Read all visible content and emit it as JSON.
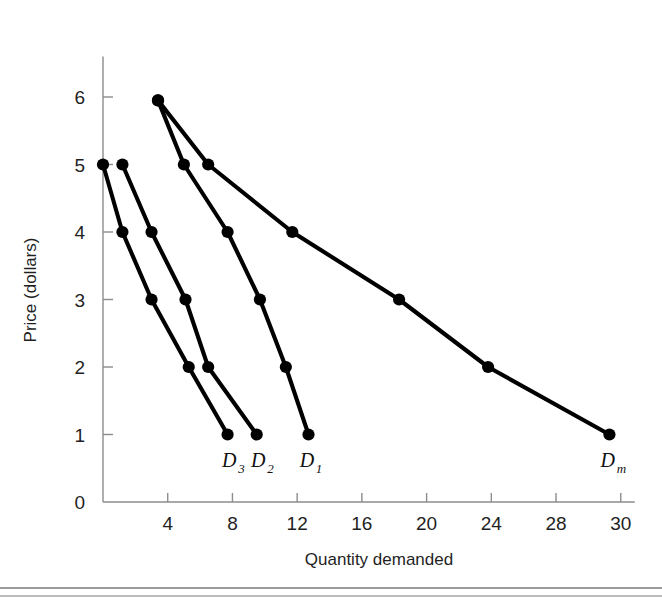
{
  "chart_data": {
    "type": "line",
    "title": "",
    "xlabel": "Quantity demanded",
    "ylabel": "Price (dollars)",
    "xlim": [
      0,
      32
    ],
    "ylim": [
      0,
      6.6
    ],
    "grid": false,
    "legend": "inline-end-labels",
    "x_ticks": [
      {
        "value": 4,
        "label": "4"
      },
      {
        "value": 8,
        "label": "8"
      },
      {
        "value": 12,
        "label": "12"
      },
      {
        "value": 16,
        "label": "16"
      },
      {
        "value": 20,
        "label": "20"
      },
      {
        "value": 24,
        "label": "24"
      },
      {
        "value": 28,
        "label": "28"
      },
      {
        "value": 32,
        "label": "30"
      }
    ],
    "y_ticks": [
      {
        "value": 0,
        "label": "0"
      },
      {
        "value": 1,
        "label": "1"
      },
      {
        "value": 2,
        "label": "2"
      },
      {
        "value": 3,
        "label": "3"
      },
      {
        "value": 4,
        "label": "4"
      },
      {
        "value": 5,
        "label": "5"
      },
      {
        "value": 6,
        "label": "6"
      }
    ],
    "series": [
      {
        "name": "D3",
        "label_base": "D",
        "label_sub": "3",
        "label_x": 7.8,
        "label_y": 0.52,
        "points": [
          {
            "x": 0.0,
            "y": 5.0
          },
          {
            "x": 1.2,
            "y": 4.0
          },
          {
            "x": 3.0,
            "y": 3.0
          },
          {
            "x": 5.3,
            "y": 2.0
          },
          {
            "x": 7.7,
            "y": 1.0
          }
        ]
      },
      {
        "name": "D2",
        "label_base": "D",
        "label_sub": "2",
        "label_x": 9.6,
        "label_y": 0.52,
        "points": [
          {
            "x": 1.2,
            "y": 5.0
          },
          {
            "x": 3.0,
            "y": 4.0
          },
          {
            "x": 5.1,
            "y": 3.0
          },
          {
            "x": 6.5,
            "y": 2.0
          },
          {
            "x": 9.5,
            "y": 1.0
          }
        ]
      },
      {
        "name": "D1",
        "label_base": "D",
        "label_sub": "1",
        "label_x": 12.6,
        "label_y": 0.52,
        "points": [
          {
            "x": 3.4,
            "y": 5.95
          },
          {
            "x": 5.0,
            "y": 5.0
          },
          {
            "x": 7.7,
            "y": 4.0
          },
          {
            "x": 9.7,
            "y": 3.0
          },
          {
            "x": 11.3,
            "y": 2.0
          },
          {
            "x": 12.7,
            "y": 1.0
          }
        ]
      },
      {
        "name": "Dm",
        "label_base": "D",
        "label_sub": "m",
        "label_x": 31.2,
        "label_y": 0.52,
        "points": [
          {
            "x": 3.4,
            "y": 5.95
          },
          {
            "x": 6.5,
            "y": 5.0
          },
          {
            "x": 11.7,
            "y": 4.0
          },
          {
            "x": 18.3,
            "y": 3.0
          },
          {
            "x": 23.8,
            "y": 2.0
          },
          {
            "x": 31.3,
            "y": 1.0
          }
        ]
      }
    ],
    "colors": {
      "curve": "#000000",
      "axis": "#8c8c8c",
      "text": "#1f1f1f",
      "background": "#ffffff"
    }
  },
  "figure": {
    "caption_rules": 2
  }
}
